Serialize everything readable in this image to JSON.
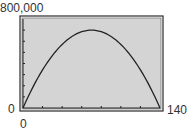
{
  "chart_data": {
    "type": "line",
    "title": "",
    "xlabel": "",
    "ylabel": "",
    "xlim": [
      0,
      140
    ],
    "ylim": [
      0,
      800000
    ],
    "x_tick_interval": 20,
    "y_tick_interval": 100000,
    "grid": false,
    "legend": null,
    "axis_labels": {
      "y_max": "800,000",
      "y_min": "0",
      "x_min": "0",
      "x_max": "140"
    },
    "series": [
      {
        "name": "parabola",
        "description": "Downward-opening parabola with roots at x=0 and x=140, vertex near (70, 700000)",
        "x": [
          0,
          10,
          20,
          30,
          40,
          50,
          60,
          70,
          80,
          90,
          100,
          110,
          120,
          130,
          140
        ],
        "values": [
          0,
          185714,
          342857,
          471429,
          571429,
          642857,
          685714,
          700000,
          685714,
          642857,
          571429,
          471429,
          342857,
          185714,
          0
        ]
      }
    ]
  },
  "colors": {
    "plot_background": "#d4d4d4",
    "frame": "#2b2b2b",
    "curve": "#222222",
    "label_text": "#333333"
  }
}
